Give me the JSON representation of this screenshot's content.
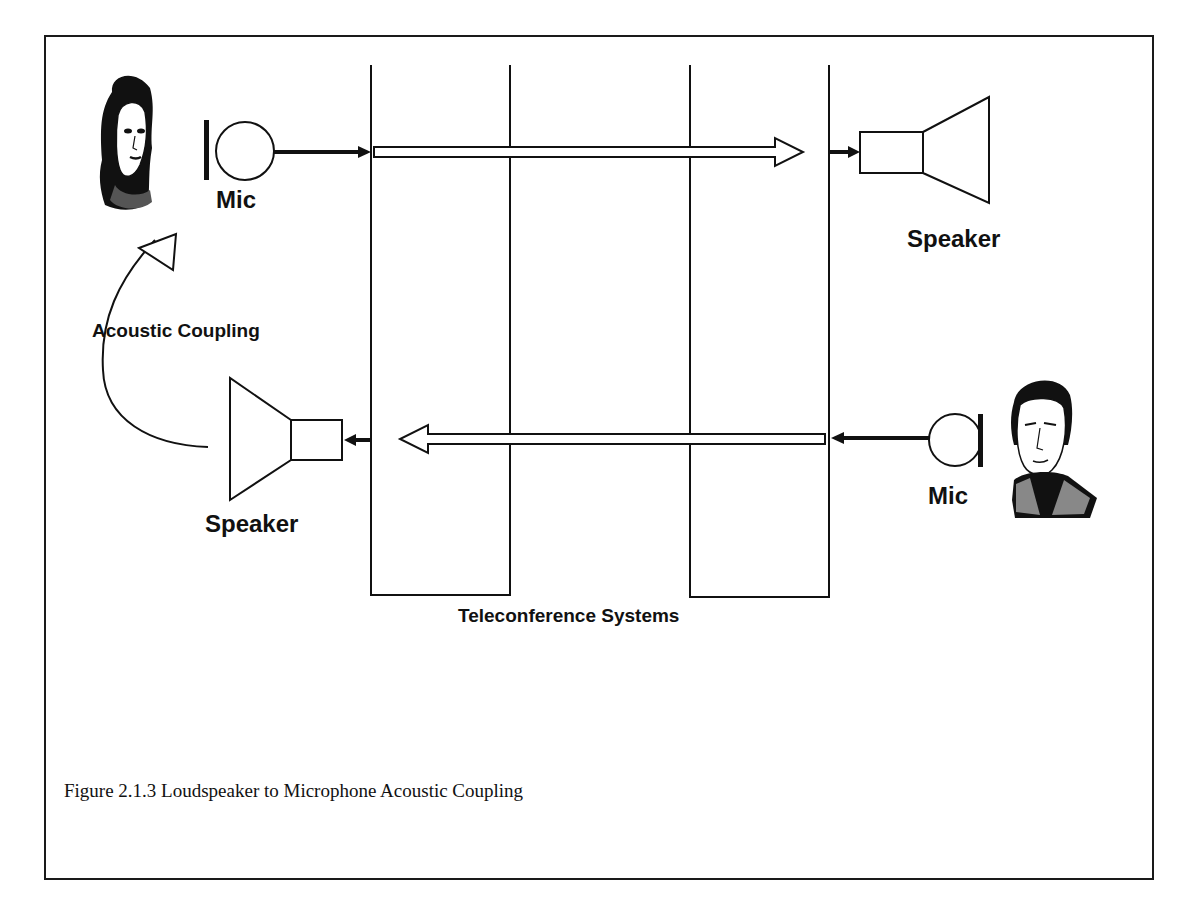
{
  "diagram": {
    "labels": {
      "mic_top": "Mic",
      "speaker_top": "Speaker",
      "acoustic_coupling": "Acoustic Coupling",
      "speaker_bottom": "Speaker",
      "mic_bottom": "Mic",
      "systems": "Teleconference Systems"
    },
    "caption": "Figure 2.1.3  Loudspeaker to Microphone Acoustic Coupling",
    "nodes": [
      {
        "id": "person-female",
        "type": "person",
        "side": "left"
      },
      {
        "id": "mic-left",
        "type": "microphone"
      },
      {
        "id": "teleconf-system-left",
        "type": "box"
      },
      {
        "id": "teleconf-system-right",
        "type": "box"
      },
      {
        "id": "speaker-right",
        "type": "loudspeaker"
      },
      {
        "id": "speaker-left",
        "type": "loudspeaker"
      },
      {
        "id": "mic-right",
        "type": "microphone"
      },
      {
        "id": "person-male",
        "type": "person",
        "side": "right"
      }
    ],
    "edges": [
      {
        "from": "mic-left",
        "to": "teleconf-system-left"
      },
      {
        "from": "teleconf-system-left",
        "to": "teleconf-system-right",
        "style": "hollow"
      },
      {
        "from": "teleconf-system-right",
        "to": "speaker-right"
      },
      {
        "from": "mic-right",
        "to": "teleconf-system-right"
      },
      {
        "from": "teleconf-system-right",
        "to": "teleconf-system-left",
        "style": "hollow"
      },
      {
        "from": "teleconf-system-left",
        "to": "speaker-left"
      },
      {
        "from": "speaker-left",
        "to": "mic-left",
        "label": "Acoustic Coupling",
        "style": "curved"
      }
    ]
  }
}
